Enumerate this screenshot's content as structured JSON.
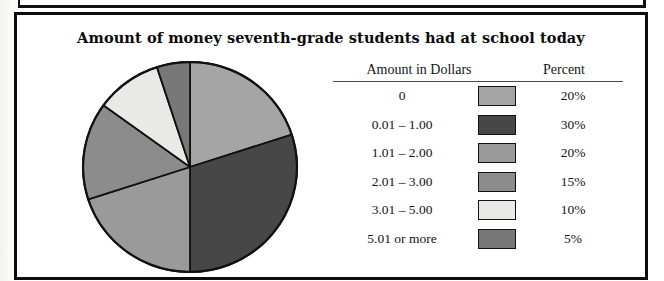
{
  "page": {
    "background_color": "#ffffff",
    "frame_color": "#0d0d0d"
  },
  "chart_data": {
    "type": "pie",
    "title": "Amount of money seventh-grade students had at school today",
    "categories": [
      "0",
      "0.01 – 1.00",
      "1.01 – 2.00",
      "2.01 – 3.00",
      "3.01 – 5.00",
      "5.01 or more"
    ],
    "values": [
      20,
      30,
      20,
      15,
      10,
      5
    ],
    "value_labels": [
      "20%",
      "30%",
      "20%",
      "15%",
      "10%",
      "5%"
    ],
    "unit": "percent",
    "colors": [
      "#a5a5a5",
      "#474747",
      "#9a9a9a",
      "#8c8c8c",
      "#e9e9e7",
      "#787878"
    ],
    "start_angle_deg": 0,
    "direction": "clockwise",
    "legend_position": "right",
    "legend_headers": [
      "Amount in Dollars",
      "Percent"
    ],
    "xlabel": "",
    "ylabel": "",
    "grid": false
  },
  "legend": {
    "header_amount": "Amount in Dollars",
    "header_percent": "Percent",
    "rows": [
      {
        "label": "0",
        "percent": "20%",
        "color": "#a5a5a5"
      },
      {
        "label": "0.01 – 1.00",
        "percent": "30%",
        "color": "#474747"
      },
      {
        "label": "1.01 – 2.00",
        "percent": "20%",
        "color": "#9a9a9a"
      },
      {
        "label": "2.01 – 3.00",
        "percent": "15%",
        "color": "#8c8c8c"
      },
      {
        "label": "3.01 – 5.00",
        "percent": "10%",
        "color": "#e9e9e7"
      },
      {
        "label": "5.01 or more",
        "percent": "5%",
        "color": "#787878"
      }
    ]
  }
}
